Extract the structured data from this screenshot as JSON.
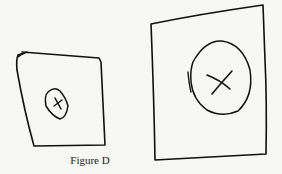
{
  "figure": {
    "caption": "Figure D",
    "ink_color": "#111111",
    "background_color": "#f7f7f5",
    "panels": [
      {
        "id": "small-square",
        "contents": "small oval with X mark"
      },
      {
        "id": "large-square",
        "contents": "large oval with X mark"
      }
    ]
  }
}
